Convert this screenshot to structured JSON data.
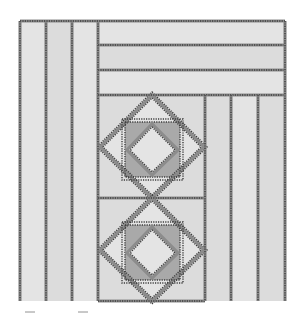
{
  "figure": {
    "type": "quilt-corner-pattern",
    "colors": {
      "background": "#ffffff",
      "fabric": "#dcdcdc",
      "fabric_light": "#e4e4e4",
      "fabric_dark_triangles": "#a9a9a9",
      "seam_stitch": "#3c3c3c",
      "seam_band": "#8c8c8c"
    },
    "border": {
      "left_vertical_strips": 3,
      "top_horizontal_strips": 3,
      "right_vertical_strips": 3
    },
    "center_blocks": [
      {
        "name": "diamond-in-square-block-1",
        "center": [
          152,
          147
        ]
      },
      {
        "name": "diamond-in-square-block-2",
        "center": [
          152,
          250
        ]
      }
    ]
  }
}
